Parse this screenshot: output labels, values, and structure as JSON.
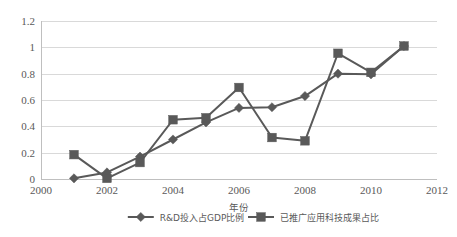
{
  "chart_data": {
    "type": "line",
    "title": "",
    "xlabel": "年份",
    "ylabel": "",
    "x": [
      2001,
      2002,
      2003,
      2004,
      2005,
      2006,
      2007,
      2008,
      2009,
      2010,
      2011
    ],
    "xlim": [
      2000,
      2012
    ],
    "ylim": [
      0,
      1.2
    ],
    "xticks": [
      "2000",
      "2002",
      "2004",
      "2006",
      "2008",
      "2010",
      "2012"
    ],
    "xtick_values": [
      2000,
      2002,
      2004,
      2006,
      2008,
      2010,
      2012
    ],
    "yticks": [
      "0",
      "0.2",
      "0.4",
      "0.6",
      "0.8",
      "1",
      "1.2"
    ],
    "ytick_values": [
      0,
      0.2,
      0.4,
      0.6,
      0.8,
      1,
      1.2
    ],
    "grid": true,
    "legend_position": "bottom",
    "series": [
      {
        "name": "R&D投入占GDP比例",
        "marker": "diamond",
        "color": "#595959",
        "values": [
          0.005,
          0.05,
          0.17,
          0.3,
          0.43,
          0.54,
          0.545,
          0.63,
          0.8,
          0.795,
          1.01
        ]
      },
      {
        "name": "已推广应用科技成果占比",
        "marker": "square",
        "color": "#595959",
        "values": [
          0.185,
          0.005,
          0.125,
          0.45,
          0.465,
          0.695,
          0.315,
          0.29,
          0.955,
          0.81,
          1.01
        ]
      }
    ]
  },
  "legend": {
    "items": [
      {
        "label": "R&D投入占GDP比例",
        "marker": "diamond"
      },
      {
        "label": "已推广应用科技成果占比",
        "marker": "square"
      }
    ]
  },
  "colors": {
    "series": "#595959",
    "grid": "#d9d9d9",
    "axis": "#bfbfbf",
    "text": "#595959",
    "background": "#ffffff"
  }
}
